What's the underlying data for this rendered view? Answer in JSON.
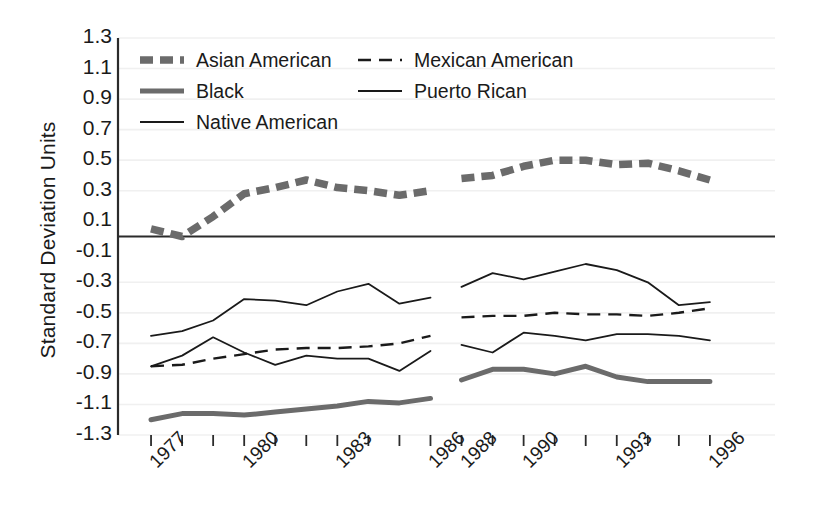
{
  "chart_data": {
    "type": "line",
    "title": "",
    "subtitle": "",
    "xlabel": "",
    "ylabel": "Standard Deviation Units",
    "ylim": [
      -1.3,
      1.3
    ],
    "ytick_labels": [
      "1.3",
      "1.1",
      "0.9",
      "0.7",
      "0.5",
      "0.3",
      "0.1",
      "-0.1",
      "-0.3",
      "-0.5",
      "-0.7",
      "-0.9",
      "-1.1",
      "-1.3"
    ],
    "ytick_values": [
      1.3,
      1.1,
      0.9,
      0.7,
      0.5,
      0.3,
      0.1,
      -0.1,
      -0.3,
      -0.5,
      -0.7,
      -0.9,
      -1.1,
      -1.3
    ],
    "grid": "horizontal-faint",
    "zero_line": true,
    "legend_position": "top-inside",
    "x": [
      1977,
      1978,
      1979,
      1980,
      1981,
      1982,
      1983,
      1984,
      1985,
      1986,
      1988,
      1989,
      1990,
      1991,
      1992,
      1993,
      1994,
      1995,
      1996
    ],
    "xtick_labels": [
      "1977",
      "1980",
      "1983",
      "1986",
      "1988",
      "1990",
      "1993",
      "1996"
    ],
    "xtick_label_values": [
      1977,
      1980,
      1983,
      1986,
      1988,
      1990,
      1993,
      1996
    ],
    "data_gap_between": [
      1986,
      1988
    ],
    "series": [
      {
        "name": "Asian American",
        "style": "thick-dashed-gray",
        "color": "#6b6b6b",
        "values": [
          0.05,
          0.0,
          0.13,
          0.28,
          0.32,
          0.37,
          0.32,
          0.3,
          0.27,
          0.3,
          0.38,
          0.4,
          0.46,
          0.5,
          0.5,
          0.47,
          0.48,
          0.43,
          0.37
        ]
      },
      {
        "name": "Mexican American",
        "style": "dashed-black",
        "color": "#1a1a1a",
        "values": [
          -0.85,
          -0.84,
          -0.8,
          -0.77,
          -0.74,
          -0.73,
          -0.73,
          -0.72,
          -0.7,
          -0.65,
          -0.53,
          -0.52,
          -0.52,
          -0.5,
          -0.51,
          -0.51,
          -0.52,
          -0.5,
          -0.47
        ]
      },
      {
        "name": "Black",
        "style": "thick-solid-gray",
        "color": "#6b6b6b",
        "values": [
          -1.2,
          -1.16,
          -1.16,
          -1.17,
          -1.15,
          -1.13,
          -1.11,
          -1.08,
          -1.09,
          -1.06,
          -0.94,
          -0.87,
          -0.87,
          -0.9,
          -0.85,
          -0.92,
          -0.95,
          -0.95,
          -0.95
        ]
      },
      {
        "name": "Puerto Rican",
        "style": "thin-solid-black",
        "color": "#1a1a1a",
        "values": [
          -0.65,
          -0.62,
          -0.55,
          -0.41,
          -0.42,
          -0.45,
          -0.36,
          -0.31,
          -0.44,
          -0.4,
          -0.33,
          -0.24,
          -0.28,
          -0.23,
          -0.18,
          -0.22,
          -0.3,
          -0.45,
          -0.43
        ]
      },
      {
        "name": "Native American",
        "style": "thin-solid-black",
        "color": "#1a1a1a",
        "values": [
          -0.85,
          -0.78,
          -0.66,
          -0.76,
          -0.84,
          -0.78,
          -0.8,
          -0.8,
          -0.88,
          -0.75,
          -0.71,
          -0.76,
          -0.63,
          -0.65,
          -0.68,
          -0.64,
          -0.64,
          -0.65,
          -0.68
        ]
      }
    ]
  },
  "legend": {
    "entries": [
      {
        "label": "Asian American",
        "style": "thick-dashed-gray"
      },
      {
        "label": "Mexican American",
        "style": "dashed-black"
      },
      {
        "label": "Black",
        "style": "thick-solid-gray"
      },
      {
        "label": "Puerto Rican",
        "style": "thin-solid-black"
      },
      {
        "label": "Native American",
        "style": "thin-solid-black"
      }
    ]
  },
  "colors": {
    "gray_series": "#6b6b6b",
    "black_series": "#1a1a1a",
    "axis": "#2b2b2b",
    "grid": "#f0f0f0",
    "background": "#ffffff"
  }
}
